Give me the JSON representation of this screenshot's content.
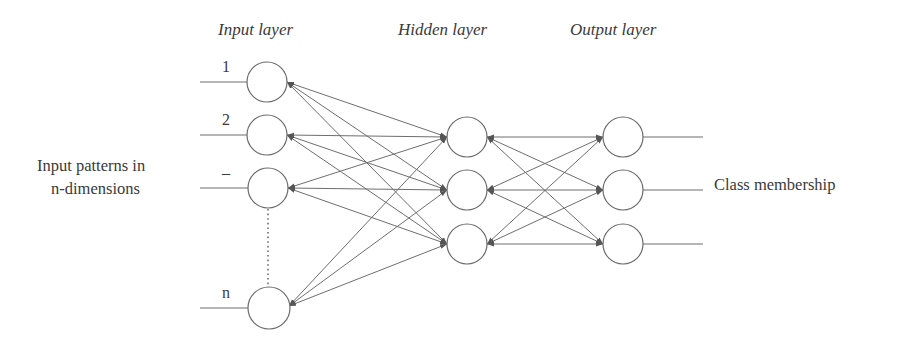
{
  "diagram": {
    "title_labels": {
      "input_layer": "Input layer",
      "hidden_layer": "Hidden layer",
      "output_layer": "Output layer"
    },
    "left_label": {
      "line1": "Input patterns in",
      "line2": "n-dimensions"
    },
    "right_label": "Class membership",
    "input_node_labels": [
      "1",
      "2",
      "–",
      "n"
    ],
    "colors": {
      "stroke": "#6e6e6e",
      "text": "#3a3a3a",
      "background": "#ffffff"
    },
    "layers": {
      "input": {
        "count": 4,
        "nodes": [
          {
            "id": "1",
            "cx": 267,
            "cy": 82
          },
          {
            "id": "2",
            "cx": 267,
            "cy": 135
          },
          {
            "id": "-",
            "cx": 268,
            "cy": 188
          },
          {
            "id": "n",
            "cx": 269,
            "cy": 308
          }
        ]
      },
      "hidden": {
        "count": 3,
        "nodes": [
          {
            "id": "h1",
            "cx": 467,
            "cy": 137
          },
          {
            "id": "h2",
            "cx": 467,
            "cy": 190
          },
          {
            "id": "h3",
            "cx": 467,
            "cy": 244
          }
        ]
      },
      "output": {
        "count": 3,
        "nodes": [
          {
            "id": "o1",
            "cx": 623,
            "cy": 137
          },
          {
            "id": "o2",
            "cx": 623,
            "cy": 190
          },
          {
            "id": "o3",
            "cx": 623,
            "cy": 244
          }
        ]
      }
    },
    "connections": "fully-connected, bidirectional arrows (input↔hidden, hidden↔output)"
  }
}
